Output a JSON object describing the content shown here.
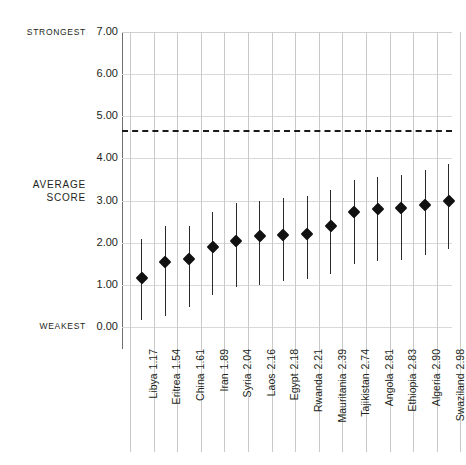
{
  "axis": {
    "strongest_label": "STRONGEST",
    "weakest_label": "WEAKEST",
    "average_label": "AVERAGE\nSCORE",
    "yticks": [
      "7.00",
      "6.00",
      "5.00",
      "4.00",
      "3.00",
      "2.00",
      "1.00",
      "0.00"
    ]
  },
  "chart_data": {
    "type": "scatter",
    "title": "",
    "xlabel": "",
    "ylabel": "AVERAGE SCORE",
    "ylim": [
      0,
      7
    ],
    "ytick_values": [
      7,
      6,
      5,
      4,
      3,
      2,
      1,
      0
    ],
    "grid": true,
    "legend": "none",
    "axis_annotations": {
      "top": "STRONGEST",
      "bottom": "WEAKEST",
      "middle": "AVERAGE SCORE"
    },
    "reference_line": {
      "value": 4.67,
      "style": "dashed",
      "color": "#1a1a1a"
    },
    "categories": [
      "Libya",
      "Eritrea",
      "China",
      "Iran",
      "Syria",
      "Laos",
      "Egypt",
      "Rwanda",
      "Mauritania",
      "Tajikistan",
      "Angola",
      "Ethiopia",
      "Algeria",
      "Swaziland"
    ],
    "values": [
      1.17,
      1.54,
      1.61,
      1.89,
      2.04,
      2.16,
      2.18,
      2.21,
      2.39,
      2.74,
      2.81,
      2.83,
      2.9,
      2.98
    ],
    "value_labels": [
      "1.17",
      "1.54",
      "1.61",
      "1.89",
      "2.04",
      "2.16",
      "2.18",
      "2.21",
      "2.39",
      "2.74",
      "2.81",
      "2.83",
      "2.90",
      "2.98"
    ],
    "range_low": [
      0.17,
      0.26,
      0.48,
      0.76,
      0.96,
      1.0,
      1.1,
      1.14,
      1.26,
      1.5,
      1.56,
      1.6,
      1.72,
      1.86
    ],
    "range_high": [
      2.1,
      2.4,
      2.4,
      2.72,
      2.94,
      2.98,
      3.06,
      3.12,
      3.24,
      3.5,
      3.56,
      3.6,
      3.73,
      3.86
    ],
    "points": [
      {
        "name": "Libya",
        "value": 1.17,
        "low": 0.17,
        "high": 2.1
      },
      {
        "name": "Eritrea",
        "value": 1.54,
        "low": 0.26,
        "high": 2.4
      },
      {
        "name": "China",
        "value": 1.61,
        "low": 0.48,
        "high": 2.4
      },
      {
        "name": "Iran",
        "value": 1.89,
        "low": 0.76,
        "high": 2.72
      },
      {
        "name": "Syria",
        "value": 2.04,
        "low": 0.96,
        "high": 2.94
      },
      {
        "name": "Laos",
        "value": 2.16,
        "low": 1.0,
        "high": 2.98
      },
      {
        "name": "Egypt",
        "value": 2.18,
        "low": 1.1,
        "high": 3.06
      },
      {
        "name": "Rwanda",
        "value": 2.21,
        "low": 1.14,
        "high": 3.12
      },
      {
        "name": "Mauritania",
        "value": 2.39,
        "low": 1.26,
        "high": 3.24
      },
      {
        "name": "Tajikistan",
        "value": 2.74,
        "low": 1.5,
        "high": 3.5
      },
      {
        "name": "Angola",
        "value": 2.81,
        "low": 1.56,
        "high": 3.56
      },
      {
        "name": "Ethiopia",
        "value": 2.83,
        "low": 1.6,
        "high": 3.6
      },
      {
        "name": "Algeria",
        "value": 2.9,
        "low": 1.72,
        "high": 3.73
      },
      {
        "name": "Swaziland",
        "value": 2.98,
        "low": 1.86,
        "high": 3.86
      }
    ]
  }
}
